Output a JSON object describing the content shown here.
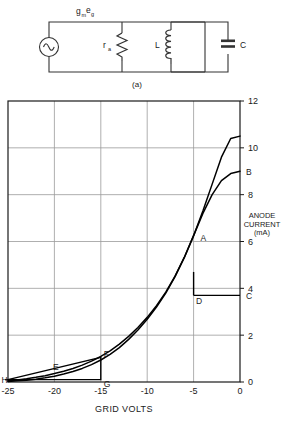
{
  "figure": {
    "caption": "(a)",
    "circuit": {
      "source_label": "gₘ e₉",
      "source_label_main": "g",
      "source_label_sub1": "m",
      "source_label_main2": "e",
      "source_label_sub2": "g",
      "resistor_label": "r",
      "resistor_sub": "a",
      "inductor_label": "L",
      "capacitor_label": "C",
      "source_icon": "ac-source-icon"
    }
  },
  "chart_data": {
    "type": "line",
    "title": "",
    "xlabel": "GRID VOLTS",
    "ylabel": "ANODE CURRENT (mA)",
    "ylabel_lines": [
      "ANODE",
      "CURRENT",
      "(mA)"
    ],
    "xlim": [
      -25,
      0
    ],
    "ylim": [
      0,
      12
    ],
    "xticks": [
      -25,
      -20,
      -15,
      -10,
      -5,
      0
    ],
    "xticklabels": [
      "-25",
      "-20",
      "-15",
      "-10",
      "-5",
      "0"
    ],
    "yticks": [
      0,
      2,
      4,
      6,
      8,
      10,
      12
    ],
    "yticklabels": [
      "0",
      "2",
      "4",
      "6",
      "8",
      "10",
      "12"
    ],
    "grid": true,
    "legend": "none",
    "series": [
      {
        "name": "curve-upper",
        "x": [
          -25,
          -24,
          -23,
          -22,
          -21,
          -20,
          -19,
          -18,
          -17,
          -16,
          -15,
          -14,
          -13,
          -12,
          -11,
          -10,
          -9,
          -8,
          -7,
          -6,
          -5,
          -4,
          -3,
          -2,
          -1,
          0
        ],
        "y": [
          0.05,
          0.09,
          0.14,
          0.2,
          0.27,
          0.36,
          0.46,
          0.58,
          0.72,
          0.89,
          1.09,
          1.33,
          1.62,
          1.95,
          2.33,
          2.76,
          3.26,
          3.84,
          4.52,
          5.32,
          6.25,
          7.3,
          8.45,
          9.6,
          10.4,
          10.5
        ]
      },
      {
        "name": "curve-lower",
        "x": [
          -25,
          -24,
          -23,
          -22,
          -21,
          -20,
          -19,
          -18,
          -17,
          -16,
          -15,
          -14,
          -13,
          -12,
          -11,
          -10,
          -9,
          -8,
          -7,
          -6,
          -5,
          -4,
          -3,
          -2,
          -1,
          0
        ],
        "y": [
          0.02,
          0.05,
          0.08,
          0.12,
          0.18,
          0.25,
          0.34,
          0.45,
          0.58,
          0.74,
          0.94,
          1.18,
          1.47,
          1.82,
          2.22,
          2.68,
          3.2,
          3.8,
          4.5,
          5.32,
          6.25,
          7.2,
          8.0,
          8.6,
          8.9,
          9.0
        ]
      }
    ],
    "annotations": [
      {
        "label": "A",
        "x": -3.4,
        "y": 6.0,
        "name": "point-a"
      },
      {
        "label": "B",
        "x": 0.0,
        "y": 9.0,
        "name": "point-b"
      },
      {
        "label": "C",
        "x": 0.0,
        "y": 3.7,
        "name": "point-c"
      },
      {
        "label": "D",
        "x": -5.0,
        "y": 3.7,
        "name": "point-d"
      },
      {
        "label": "E",
        "x": -20.0,
        "y": 0.35,
        "name": "point-e"
      },
      {
        "label": "F",
        "x": -15.0,
        "y": 1.05,
        "name": "point-f"
      },
      {
        "label": "G",
        "x": -15.0,
        "y": 0.1,
        "name": "point-g"
      },
      {
        "label": "H",
        "x": -25.0,
        "y": 0.1,
        "name": "point-h"
      }
    ]
  },
  "colors": {
    "axis": "#1a1a1a",
    "grid": "#9a9a9a",
    "curve": "#000000",
    "background": "#ffffff"
  }
}
